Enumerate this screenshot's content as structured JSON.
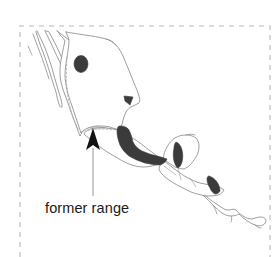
{
  "figure": {
    "type": "range-map",
    "region": "Mexico and Central America",
    "background_color": "#ffffff",
    "frame": {
      "style": "dashed",
      "color": "#b9b9b9",
      "x": 20,
      "y": 26,
      "width": 250,
      "height": 231
    }
  },
  "annotation": {
    "label": "former range",
    "label_color": "#1a1a1a",
    "leader_color": "#9a9a9a",
    "arrow_color": "#121212",
    "arrow_tip_x": 93,
    "arrow_tip_y": 129,
    "leader_bottom_y": 196,
    "label_x": 45,
    "label_y": 212
  },
  "legend_items": [
    {
      "name": "current-range",
      "label": "",
      "color": "#3b3b3b",
      "style": "solid-fill"
    },
    {
      "name": "former-range-boundary",
      "label": "former range",
      "color": "#adadad",
      "style": "dotted-line"
    }
  ],
  "map_features": {
    "outline_color": "#8d8d8d",
    "border_color": "#a5a5a5",
    "range_color": "#3b3b3b",
    "former_range_color": "#adadad",
    "range_patches": [
      {
        "name": "north-central-mexico-spot",
        "cx": 81,
        "cy": 64
      },
      {
        "name": "gulf-coast-triangle",
        "cx": 129,
        "cy": 100
      },
      {
        "name": "southern-mexico-band",
        "cx": 135,
        "cy": 145
      },
      {
        "name": "yucatan-base-patch",
        "cx": 179,
        "cy": 155
      },
      {
        "name": "honduras-nicaragua-patch",
        "cx": 215,
        "cy": 185
      }
    ]
  }
}
